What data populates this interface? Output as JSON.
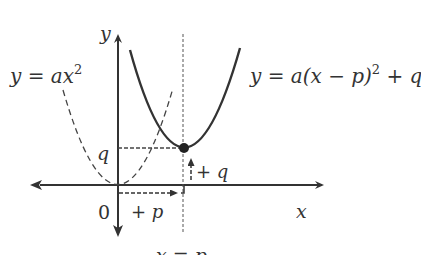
{
  "diagram": {
    "colors": {
      "stroke": "#333333",
      "background": "#ffffff"
    },
    "axes": {
      "x_label": "x",
      "y_label": "y",
      "origin_label": "0"
    },
    "curves": {
      "original": {
        "label": "y = ax",
        "exponent": "2",
        "style": "dashed"
      },
      "translated": {
        "label": "y = a(x − p)",
        "exponent": "2",
        "suffix": " + q",
        "style": "solid"
      }
    },
    "annotations": {
      "q_label": "q",
      "shift_p": "+ p",
      "shift_q": "+ q",
      "axis_of_symmetry": "x = p"
    }
  }
}
